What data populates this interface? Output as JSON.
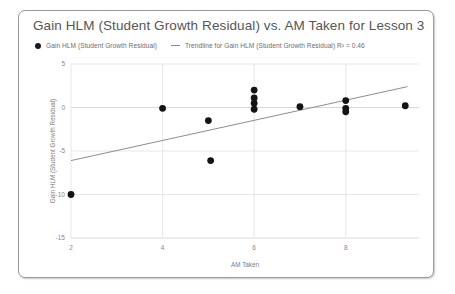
{
  "chart_card": {
    "title": "Gain HLM (Student Growth Residual) vs. AM Taken for Lesson 3"
  },
  "legend": {
    "series_label": "Gain HLM (Student Growth Residual)",
    "trendline_label": "Trendline for Gain HLM (Student Growth Residual) R² = 0.46",
    "marker_icon": "filled-circle-icon",
    "line_icon": "trendline-dash-icon"
  },
  "chart_data": {
    "type": "scatter",
    "title": "Gain HLM (Student Growth Residual) vs. AM Taken for Lesson 3",
    "xlabel": "AM Taken",
    "ylabel": "Gain HLM (Student Growth Residual)",
    "xlim": [
      2,
      9.6
    ],
    "ylim": [
      -15,
      5
    ],
    "xticks": [
      2,
      4,
      6,
      8
    ],
    "yticks": [
      5,
      0,
      -5,
      -10,
      -15
    ],
    "grid": true,
    "legend_position": "top-left",
    "series": [
      {
        "name": "Gain HLM (Student Growth Residual)",
        "marker": "circle",
        "color": "#141414",
        "points": [
          [
            2.0,
            -10.0
          ],
          [
            4.0,
            -0.1
          ],
          [
            5.0,
            -1.5
          ],
          [
            5.05,
            -6.1
          ],
          [
            6.0,
            2.0
          ],
          [
            6.0,
            1.1
          ],
          [
            6.0,
            0.5
          ],
          [
            6.0,
            -0.2
          ],
          [
            7.0,
            0.1
          ],
          [
            8.0,
            0.8
          ],
          [
            8.0,
            -0.1
          ],
          [
            8.0,
            -0.5
          ],
          [
            9.3,
            0.2
          ]
        ]
      }
    ],
    "trendline": {
      "name": "Trendline for Gain HLM (Student Growth Residual)",
      "r_squared": 0.46,
      "r_squared_label": "R² = 0.46",
      "x_start": 2.0,
      "y_start": -6.1,
      "x_end": 9.35,
      "y_end": 2.4,
      "color": "#8d8d8d"
    }
  }
}
